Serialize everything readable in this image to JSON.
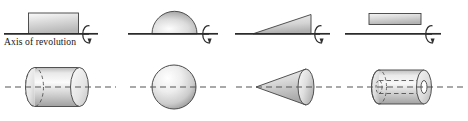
{
  "figure": {
    "title_text": "Axis of revolution",
    "colors": {
      "axis_line": "#2b2b2b",
      "dashed_axis": "#555555",
      "shape_outline": "#4a4a4a",
      "shape_fill_light": "#f2f2f2",
      "shape_fill_mid": "#d2d2d2",
      "shape_fill_dark": "#9a9a9a",
      "background": "#ffffff",
      "text": "#151515"
    }
  },
  "axis_label": {
    "text": "Axis of revolution"
  },
  "panels": [
    {
      "id": "panel-1",
      "region_name": "rectangle-on-axis",
      "region_label": "rectangle",
      "solid_name": "cylinder",
      "solid_label": "cylinder",
      "rotation_icon": "rotation-arrow-icon"
    },
    {
      "id": "panel-2",
      "region_name": "semicircle-on-axis",
      "region_label": "semicircle",
      "solid_name": "sphere",
      "solid_label": "sphere",
      "rotation_icon": "rotation-arrow-icon"
    },
    {
      "id": "panel-3",
      "region_name": "right-triangle-on-axis",
      "region_label": "right triangle",
      "solid_name": "cone",
      "solid_label": "cone",
      "rotation_icon": "rotation-arrow-icon"
    },
    {
      "id": "panel-4",
      "region_name": "rectangle-offset-from-axis",
      "region_label": "offset rectangle",
      "solid_name": "hollow-tube",
      "solid_label": "tube (annular cylinder)",
      "rotation_icon": "rotation-arrow-icon"
    }
  ]
}
